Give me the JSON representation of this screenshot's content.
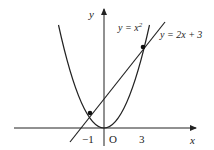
{
  "diagram": {
    "axes": {
      "x_label": "x",
      "y_label": "y",
      "origin_label": "O",
      "ticks": [
        {
          "label": "−1",
          "value": -1
        },
        {
          "label": "3",
          "value": 3
        }
      ]
    },
    "curves": [
      {
        "name": "parabola",
        "label_lhs": "y = x",
        "label_exp": "2",
        "equation": "y = x^2"
      },
      {
        "name": "line",
        "label": "y = 2x + 3",
        "equation": "y = 2x + 3"
      }
    ],
    "intersections": [
      {
        "x": -1,
        "y": 1
      },
      {
        "x": 3,
        "y": 9
      }
    ],
    "colors": {
      "stroke": "#222222",
      "background": "#ffffff"
    }
  }
}
